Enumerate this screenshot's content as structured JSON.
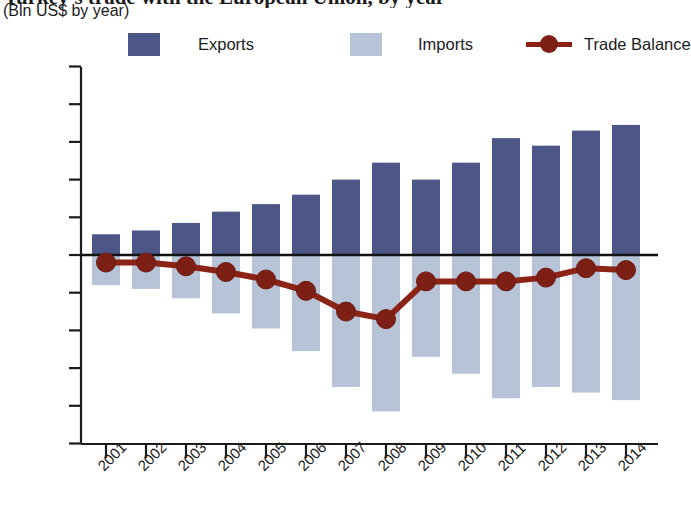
{
  "header": {
    "title": "Turkey's trade with the European Union, by year",
    "subtitle": "(Bln US$ by year)"
  },
  "legend": {
    "position": "top",
    "items": [
      {
        "label": "Exports",
        "color": "#4c5788",
        "marker": "square"
      },
      {
        "label": "Imports",
        "color": "#b7c4d8",
        "marker": "square"
      },
      {
        "label": "Trade Balance",
        "color": "#8c2317",
        "marker": "line-dot"
      }
    ]
  },
  "axes": {
    "y_ticks": [
      "100",
      "80",
      "60",
      "40",
      "20",
      "0",
      "−20",
      "−40",
      "−60",
      "−80",
      "−100"
    ],
    "x_ticks": [
      "2001",
      "2002",
      "2003",
      "2004",
      "2005",
      "2006",
      "2007",
      "2008",
      "2009",
      "2010",
      "2011",
      "2012",
      "2013",
      "2014"
    ]
  },
  "chart_data": {
    "type": "bar",
    "title": "Turkey's trade with the European Union, by year",
    "subtitle": "(Bln US$ by year)",
    "xlabel": "",
    "ylabel": "Bln US$ by year",
    "ylim": [
      -100,
      100
    ],
    "ytick_step": 20,
    "grid": false,
    "legend_position": "top",
    "categories": [
      "2001",
      "2002",
      "2003",
      "2004",
      "2005",
      "2006",
      "2007",
      "2008",
      "2009",
      "2010",
      "2011",
      "2012",
      "2013",
      "2014"
    ],
    "series": [
      {
        "name": "Exports",
        "type": "bar",
        "color": "#4c5788",
        "values": [
          11,
          13,
          17,
          23,
          27,
          32,
          40,
          49,
          40,
          49,
          62,
          58,
          66,
          69
        ]
      },
      {
        "name": "Imports",
        "type": "bar",
        "color": "#b7c4d8",
        "values": [
          -16,
          -18,
          -23,
          -31,
          -39,
          -51,
          -70,
          -83,
          -54,
          -63,
          -76,
          -70,
          -73,
          -77
        ]
      },
      {
        "name": "Trade Balance",
        "type": "line",
        "color": "#8c2317",
        "values": [
          -4,
          -4,
          -6,
          -9,
          -13,
          -19,
          -30,
          -34,
          -14,
          -14,
          -14,
          -12,
          -7,
          -8
        ]
      }
    ]
  }
}
